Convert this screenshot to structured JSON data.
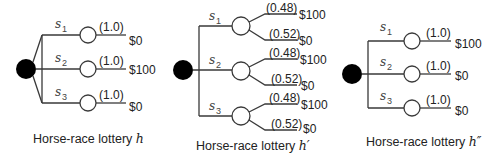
{
  "diagrams": [
    {
      "caption": "Horse-race lottery ",
      "caption_var": "h",
      "states": [
        {
          "label": "s",
          "sub": "1",
          "outcomes": [
            {
              "prob": "(1.0)",
              "payoff": "$0"
            }
          ]
        },
        {
          "label": "s",
          "sub": "2",
          "outcomes": [
            {
              "prob": "(1.0)",
              "payoff": "$100"
            }
          ]
        },
        {
          "label": "s",
          "sub": "3",
          "outcomes": [
            {
              "prob": "(1.0)",
              "payoff": "$0"
            }
          ]
        }
      ]
    },
    {
      "caption": "Horse-race lottery ",
      "caption_var": "h′",
      "states": [
        {
          "label": "s",
          "sub": "1",
          "outcomes": [
            {
              "prob": "(0.48)",
              "payoff": "$100"
            },
            {
              "prob": "(0.52)",
              "payoff": "$0"
            }
          ]
        },
        {
          "label": "s",
          "sub": "2",
          "outcomes": [
            {
              "prob": "(0.48)",
              "payoff": "$100"
            },
            {
              "prob": "(0.52)",
              "payoff": "$0"
            }
          ]
        },
        {
          "label": "s",
          "sub": "3",
          "outcomes": [
            {
              "prob": "(0.48)",
              "payoff": "$100"
            },
            {
              "prob": "(0.52)",
              "payoff": "$0"
            }
          ]
        }
      ]
    },
    {
      "caption": "Horse-race lottery ",
      "caption_var": "h″",
      "states": [
        {
          "label": "s",
          "sub": "1",
          "outcomes": [
            {
              "prob": "(1.0)",
              "payoff": "$100"
            }
          ]
        },
        {
          "label": "s",
          "sub": "2",
          "outcomes": [
            {
              "prob": "(1.0)",
              "payoff": "$0"
            }
          ]
        },
        {
          "label": "s",
          "sub": "3",
          "outcomes": [
            {
              "prob": "(1.0)",
              "payoff": "$0"
            }
          ]
        }
      ]
    }
  ]
}
